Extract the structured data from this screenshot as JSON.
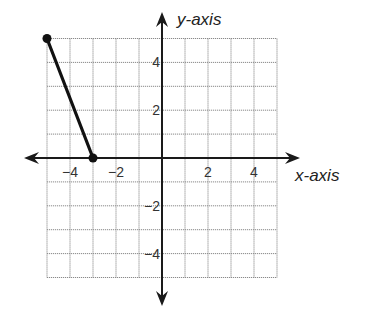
{
  "chart_data": {
    "type": "line",
    "title": "",
    "xlabel": "x-axis",
    "ylabel": "y-axis",
    "xlim": [
      -5,
      5
    ],
    "ylim": [
      -5,
      5
    ],
    "grid": true,
    "grid_step": 1,
    "x_ticks": [
      -4,
      -2,
      2,
      4
    ],
    "y_ticks": [
      4,
      2,
      -2,
      -4
    ],
    "x_tick_labels": [
      "−4",
      "−2",
      "2",
      "4"
    ],
    "y_tick_labels": [
      "4",
      "2",
      "−2",
      "−4"
    ],
    "series": [
      {
        "name": "segment",
        "points": [
          [
            -5,
            5
          ],
          [
            -3,
            0
          ]
        ],
        "endpoints": "closed"
      }
    ]
  },
  "layout": {
    "origin_px": [
      162,
      158
    ],
    "unit_x_px": 23,
    "unit_y_px": 23.9,
    "x_axis_arrow_left": 24,
    "x_axis_arrow_right": 300,
    "y_axis_arrow_top": 12,
    "y_axis_arrow_bottom": 306
  },
  "colors": {
    "axis": "#1a1a1a",
    "grid": "#8a8a8a",
    "segment": "#111111",
    "text": "#333333"
  }
}
